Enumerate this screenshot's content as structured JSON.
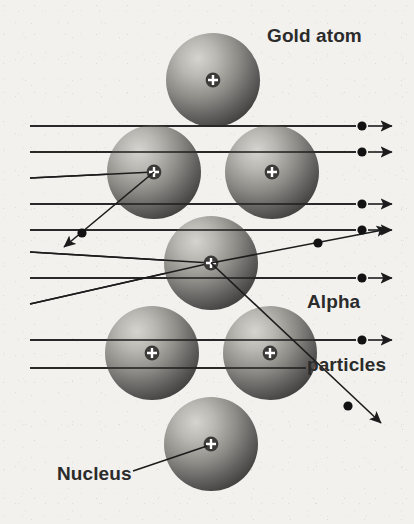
{
  "figure": {
    "background_color": "#f2f1ee",
    "width": 414,
    "height": 524
  },
  "labels": {
    "gold_atom": "Gold atom",
    "alpha_particles_line1": "Alpha",
    "alpha_particles_line2": "particles",
    "nucleus": "Nucleus",
    "text_color": "#2b2b2b"
  },
  "atoms": {
    "radius": 47,
    "nucleus_radius": 7,
    "nucleus_symbol": "+",
    "nucleus_color": "#3a3a3a",
    "nucleus_symbol_color": "#ffffff",
    "sphere_light": "#c9c7c2",
    "sphere_dark": "#4a4845",
    "positions": [
      {
        "name": "top-atom",
        "cx": 213,
        "cy": 80
      },
      {
        "name": "upper-left-atom",
        "cx": 154,
        "cy": 172
      },
      {
        "name": "upper-right-atom",
        "cx": 272,
        "cy": 172
      },
      {
        "name": "center-atom",
        "cx": 211,
        "cy": 263
      },
      {
        "name": "lower-left-atom",
        "cx": 152,
        "cy": 353
      },
      {
        "name": "lower-right-atom",
        "cx": 270,
        "cy": 353
      },
      {
        "name": "bottom-atom",
        "cx": 211,
        "cy": 444
      }
    ]
  },
  "beams": {
    "stroke_color": "#1c1c1c",
    "stroke_width": 1.6,
    "particle_dot_radius": 4.4,
    "straight_rays": [
      {
        "name": "ray-1",
        "y": 126,
        "x_start": 30,
        "x_end": 355,
        "dot_x": 362,
        "arrow_tip_x": 396
      },
      {
        "name": "ray-2",
        "y": 152,
        "x_start": 30,
        "x_end": 355,
        "dot_x": 362,
        "arrow_tip_x": 396
      },
      {
        "name": "ray-4",
        "y": 204,
        "x_start": 30,
        "x_end": 355,
        "dot_x": 362,
        "arrow_tip_x": 396
      },
      {
        "name": "ray-5",
        "y": 230,
        "x_start": 30,
        "x_end": 355,
        "dot_x": 362,
        "arrow_tip_x": 396
      },
      {
        "name": "ray-7",
        "y": 278,
        "x_start": 30,
        "x_end": 355,
        "dot_x": 362,
        "arrow_tip_x": 396
      },
      {
        "name": "ray-9",
        "y": 340,
        "x_start": 30,
        "x_end": 355,
        "dot_x": 362,
        "arrow_tip_x": 396
      },
      {
        "name": "ray-10",
        "y": 368,
        "x_start": 30,
        "x_end": 306,
        "dot_x": 0,
        "arrow_tip_x": 0
      }
    ],
    "backscattered_ray": {
      "name": "backscattered-ray",
      "incoming_y": 178,
      "incoming_x_start": 30,
      "nucleus_x": 154,
      "nucleus_y": 172,
      "dot_x": 82,
      "dot_y": 233,
      "arrow_tip_x": 57,
      "arrow_tip_y": 252
    },
    "deflected_up_ray": {
      "name": "deflected-up-ray",
      "incoming_y": 252,
      "incoming_x_start": 30,
      "nucleus_x": 211,
      "nucleus_y": 263,
      "dot_x": 318,
      "dot_y": 243,
      "arrow_tip_x": 390,
      "arrow_tip_y": 228
    },
    "deflected_down_ray": {
      "name": "deflected-down-ray",
      "incoming_y": 252,
      "incoming_x_start": 30,
      "nucleus_x": 211,
      "nucleus_y": 263,
      "dot_x": 348,
      "dot_y": 406,
      "arrow_tip_x": 383,
      "arrow_tip_y": 425
    },
    "nucleus_leader_line": {
      "name": "nucleus-leader-line",
      "x_start": 133,
      "y_start": 471,
      "x_end": 209,
      "y_end": 444
    }
  }
}
